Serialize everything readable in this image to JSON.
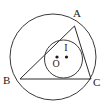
{
  "figure": {
    "background_color": "#ffffff",
    "stroke_color": "#2b2b2b",
    "label_color": "#1a1a1a",
    "width": 106,
    "height": 111
  },
  "labels": {
    "vertex_a": "A",
    "vertex_b": "B",
    "vertex_c": "C",
    "incenter": "I",
    "circumcenter": "O"
  },
  "geometry": {
    "circumcircle": {
      "cx": 53,
      "cy": 57,
      "r": 43
    },
    "incircle": {
      "cx": 63.5,
      "cy": 59,
      "r": 19
    },
    "vertices": {
      "a": {
        "x": 74.5,
        "y": 26
      },
      "b": {
        "x": 20,
        "y": 79
      },
      "c": {
        "x": 91,
        "y": 79
      }
    },
    "markers": [
      {
        "name": "circumcenter-dot",
        "x": 57,
        "y": 57,
        "r": 1.6
      },
      {
        "name": "incenter-dot",
        "x": 66.5,
        "y": 57,
        "r": 1.6
      }
    ],
    "label_positions": {
      "a": {
        "x": 77,
        "y": 17
      },
      "b": {
        "x": 3,
        "y": 83
      },
      "c": {
        "x": 93,
        "y": 85
      },
      "i": {
        "x": 63,
        "y": 50
      },
      "o": {
        "x": 52,
        "y": 67
      }
    }
  }
}
